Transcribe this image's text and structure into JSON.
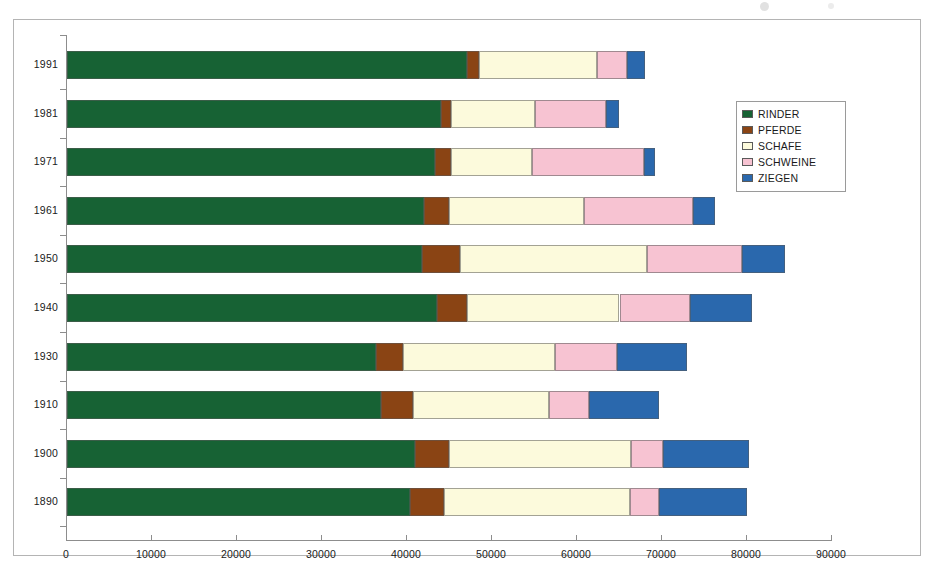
{
  "chart_data": {
    "type": "bar",
    "orientation": "horizontal",
    "stacked": true,
    "title": "",
    "subtitle": "",
    "xlabel": "",
    "ylabel": "",
    "grid": false,
    "xlim": [
      0,
      90000
    ],
    "legend_position": "right",
    "categories": [
      "1991",
      "1981",
      "1971",
      "1961",
      "1950",
      "1940",
      "1930",
      "1910",
      "1900",
      "1890"
    ],
    "xticks": [
      0,
      10000,
      20000,
      30000,
      40000,
      50000,
      60000,
      70000,
      80000,
      90000
    ],
    "xtick_labels": [
      "0",
      "10000",
      "20000",
      "30000",
      "40000",
      "50000",
      "60000",
      "70000",
      "80000",
      "90000"
    ],
    "series": [
      {
        "name": "RINDER",
        "color": "#176234",
        "values": [
          47000,
          44000,
          43300,
          42000,
          41800,
          43500,
          36300,
          36900,
          40900,
          40300
        ]
      },
      {
        "name": "PFERDE",
        "color": "#8a4414",
        "values": [
          1500,
          1200,
          1900,
          2900,
          4400,
          3600,
          3200,
          3800,
          4000,
          4100
        ]
      },
      {
        "name": "SCHAFE",
        "color": "#fcfadc",
        "values": [
          13800,
          9900,
          9500,
          15900,
          22000,
          17900,
          17900,
          16000,
          21500,
          21800
        ]
      },
      {
        "name": "SCHWEINE",
        "color": "#f7c3d2",
        "values": [
          3600,
          8300,
          13200,
          12800,
          11200,
          8300,
          7300,
          4700,
          3700,
          3500
        ]
      },
      {
        "name": "ZIEGEN",
        "color": "#2a68ad",
        "values": [
          2100,
          1500,
          1300,
          2600,
          5100,
          7300,
          8300,
          8300,
          10100,
          10300
        ]
      }
    ],
    "totals": [
      68000,
      64900,
      69200,
      76200,
      84500,
      80600,
      73000,
      69700,
      80200,
      80000
    ]
  },
  "legend": {
    "items": [
      {
        "label": "RINDER",
        "color": "#176234"
      },
      {
        "label": "PFERDE",
        "color": "#8a4414"
      },
      {
        "label": "SCHAFE",
        "color": "#fcfadc"
      },
      {
        "label": "SCHWEINE",
        "color": "#f7c3d2"
      },
      {
        "label": "ZIEGEN",
        "color": "#2a68ad"
      }
    ]
  },
  "colors": {
    "frame_border": "#b4b4b4",
    "axis": "#8d8d8d",
    "text": "#1a1a1a",
    "background": "#ffffff"
  }
}
